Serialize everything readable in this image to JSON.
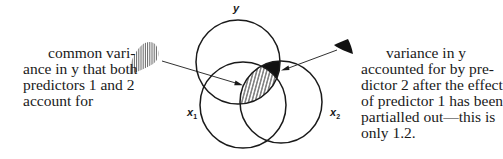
{
  "diagram": {
    "type": "venn",
    "circles": [
      {
        "id": "y",
        "label": "y",
        "cx": 238,
        "cy": 62,
        "r": 42
      },
      {
        "id": "x1",
        "label": "x",
        "subscript": "1",
        "cx": 243,
        "cy": 105,
        "r": 43
      },
      {
        "id": "x2",
        "label": "x",
        "subscript": "2",
        "cx": 281,
        "cy": 102,
        "r": 41
      }
    ],
    "labels": {
      "y": "y",
      "x1_base": "x",
      "x1_sub": "1",
      "x2_base": "x",
      "x2_sub": "2"
    },
    "left_caption": {
      "lines": [
        "common vari-",
        "ance in y that both",
        "predictors 1 and 2",
        "account for"
      ]
    },
    "right_caption": {
      "lines": [
        "variance in y",
        "accounted for by pre-",
        "dictor 2 after the effect",
        "of predictor 1 has been",
        "partialled out—this is",
        "only 1.2."
      ]
    },
    "colors": {
      "stroke": "#1a1a1a",
      "fill_solid": "#111111",
      "background": "#ffffff"
    }
  }
}
